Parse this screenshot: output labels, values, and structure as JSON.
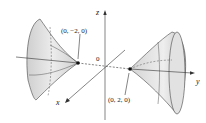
{
  "figure": {
    "axes": {
      "x": "x",
      "y": "y",
      "z": "z",
      "origin": "0"
    },
    "points": [
      {
        "label": "(0, −2, 0)"
      },
      {
        "label": "(0, 2, 0)"
      }
    ],
    "colors": {
      "surface": "#d8d8d8",
      "surface_dark": "#b8b8b8",
      "line": "#333333"
    }
  }
}
